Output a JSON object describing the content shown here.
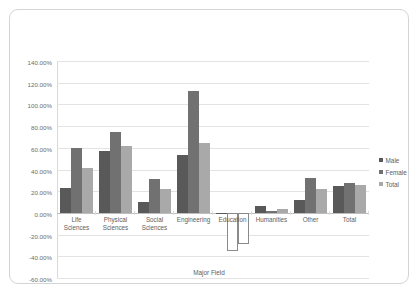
{
  "chart_data": {
    "type": "bar",
    "title": "",
    "xlabel": "Major Field",
    "ylabel": "",
    "ylim": [
      -60,
      140
    ],
    "ytick_labels": [
      "140.00%",
      "120.00%",
      "100.00%",
      "80.00%",
      "60.00%",
      "40.00%",
      "20.00%",
      "0.00%",
      "-20.00%",
      "-40.00%",
      "-60.00%"
    ],
    "ytick_values": [
      140,
      120,
      100,
      80,
      60,
      40,
      20,
      0,
      -20,
      -40,
      -60
    ],
    "grid": true,
    "legend_position": "right",
    "categories": [
      "Life Sciences",
      "Physical Sciences",
      "Social Sciences",
      "Engineering",
      "Education",
      "Humanities",
      "Other",
      "Total"
    ],
    "category_lines": [
      [
        "Life",
        "Sciences"
      ],
      [
        "Physical",
        "Sciences"
      ],
      [
        "Social",
        "Sciences"
      ],
      [
        "Engineering"
      ],
      [
        "Education"
      ],
      [
        "Humanities"
      ],
      [
        "Other"
      ],
      [
        "Total"
      ]
    ],
    "series": [
      {
        "name": "Male",
        "color": "#595959",
        "values": [
          22.5,
          57.0,
          10.0,
          53.5,
          0.0,
          6.0,
          12.0,
          25.0
        ]
      },
      {
        "name": "Female",
        "color": "#717171",
        "values": [
          60.0,
          75.0,
          31.5,
          112.0,
          -35.0,
          2.0,
          32.0,
          27.5
        ]
      },
      {
        "name": "Total",
        "color": "#a9a9a9",
        "values": [
          41.5,
          62.0,
          22.0,
          64.5,
          -29.0,
          4.0,
          22.0,
          26.0
        ]
      }
    ]
  },
  "legend": {
    "items": [
      {
        "label": "Male"
      },
      {
        "label": "Female"
      },
      {
        "label": "Total"
      }
    ]
  }
}
